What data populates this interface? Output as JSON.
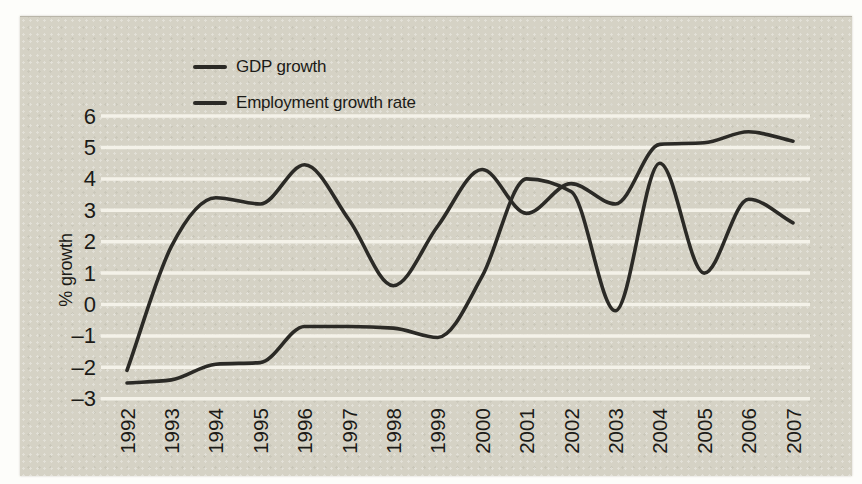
{
  "figure": {
    "colors": {
      "page_background": "#fdfdfa",
      "panel_background": "#d5d2c5",
      "gridline": "#f4f2e9",
      "line": "#2b2a26",
      "text": "#1c1b17"
    }
  },
  "legend": {
    "position": "top-left",
    "items": [
      {
        "label": "GDP growth",
        "swatch": "solid dark line"
      },
      {
        "label": "Employment growth rate",
        "swatch": "solid dark line"
      }
    ]
  },
  "axes": {
    "ylabel": "% growth",
    "yticklabels": [
      "6",
      "5",
      "4",
      "3",
      "2",
      "1",
      "0",
      "–1",
      "–2",
      "–3"
    ],
    "xticklabels": [
      "1992",
      "1993",
      "1994",
      "1995",
      "1996",
      "1997",
      "1998",
      "1999",
      "2000",
      "2001",
      "2002",
      "2003",
      "2004",
      "2005",
      "2006",
      "2007"
    ],
    "xtick_rotation_deg": -90
  },
  "chart_data": {
    "type": "line",
    "title": "",
    "xlabel": "",
    "ylabel": "% growth",
    "x": [
      1992,
      1993,
      1994,
      1995,
      1996,
      1997,
      1998,
      1999,
      2000,
      2001,
      2002,
      2003,
      2004,
      2005,
      2006,
      2007
    ],
    "series": [
      {
        "name": "GDP growth",
        "color": "#2b2a26",
        "values": [
          -2.1,
          1.85,
          3.4,
          3.2,
          4.45,
          2.7,
          0.6,
          2.5,
          4.3,
          2.9,
          3.85,
          3.2,
          5.1,
          5.15,
          5.5,
          5.2
        ]
      },
      {
        "name": "Employment growth rate",
        "color": "#2b2a26",
        "values": [
          -2.5,
          -2.4,
          -1.9,
          -1.85,
          -0.7,
          -0.7,
          -0.75,
          -1.05,
          0.9,
          4.0,
          3.6,
          -0.2,
          4.5,
          1.0,
          3.35,
          2.6
        ]
      }
    ],
    "ylim": [
      -3,
      6
    ],
    "yticks": [
      6,
      5,
      4,
      3,
      2,
      1,
      0,
      -1,
      -2,
      -3
    ],
    "grid": "horizontal",
    "legend_position": "top-left inside plot"
  }
}
